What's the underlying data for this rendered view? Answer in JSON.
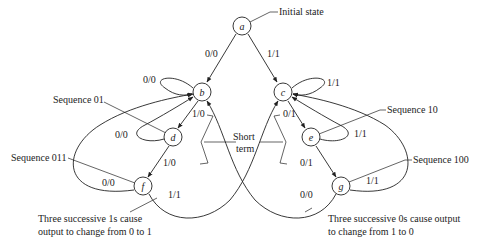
{
  "diagram": {
    "type": "state-diagram",
    "nodes": [
      {
        "id": "a",
        "label": "a"
      },
      {
        "id": "b",
        "label": "b"
      },
      {
        "id": "c",
        "label": "c"
      },
      {
        "id": "d",
        "label": "d"
      },
      {
        "id": "e",
        "label": "e"
      },
      {
        "id": "f",
        "label": "f"
      },
      {
        "id": "g",
        "label": "g"
      }
    ],
    "edges": [
      {
        "from": "a",
        "to": "b",
        "label": "0/0"
      },
      {
        "from": "a",
        "to": "c",
        "label": "1/1"
      },
      {
        "from": "b",
        "to": "b",
        "label": "0/0"
      },
      {
        "from": "c",
        "to": "c",
        "label": "1/1"
      },
      {
        "from": "b",
        "to": "d",
        "label": "1/0"
      },
      {
        "from": "d",
        "to": "b",
        "label": "0/0"
      },
      {
        "from": "d",
        "to": "f",
        "label": "1/0"
      },
      {
        "from": "f",
        "to": "b",
        "label": "0/0"
      },
      {
        "from": "f",
        "to": "c",
        "label": "1/1"
      },
      {
        "from": "c",
        "to": "e",
        "label": "0/1"
      },
      {
        "from": "e",
        "to": "c",
        "label": "1/1"
      },
      {
        "from": "e",
        "to": "g",
        "label": "0/1"
      },
      {
        "from": "g",
        "to": "c",
        "label": "1/1"
      },
      {
        "from": "g",
        "to": "b",
        "label": "0/0"
      }
    ],
    "annotations": {
      "initial_state": "Initial state",
      "seq01": "Sequence 01",
      "seq011": "Sequence 011",
      "seq10": "Sequence 10",
      "seq100": "Sequence 100",
      "short": "Short",
      "term": "term",
      "ones_line1": "Three successive 1s cause",
      "ones_line2": "output to change from 0 to 1",
      "zeros_line1": "Three successive 0s cause output",
      "zeros_line2": "to change from 1 to 0"
    }
  }
}
